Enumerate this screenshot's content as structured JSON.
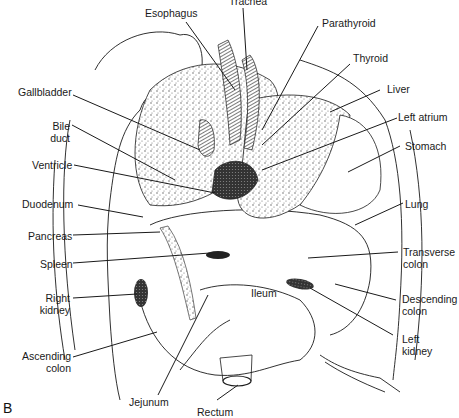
{
  "figure": {
    "panel_label": "B",
    "labels": {
      "trachea": "Trachea",
      "esophagus": "Esophagus",
      "parathyroid": "Parathyroid",
      "thyroid": "Thyroid",
      "liver": "Liver",
      "left_atrium": "Left atrium",
      "stomach": "Stomach",
      "lung": "Lung",
      "transverse_colon_1": "Transverse",
      "transverse_colon_2": "colon",
      "descending_colon_1": "Descending",
      "descending_colon_2": "colon",
      "left_kidney_1": "Left",
      "left_kidney_2": "kidney",
      "gallbladder": "Gallbladder",
      "bile_duct_1": "Bile",
      "bile_duct_2": "duct",
      "ventricle": "Ventricle",
      "duodenum": "Duodenum",
      "pancreas": "Pancreas",
      "spleen": "Spleen",
      "right_kidney_1": "Right",
      "right_kidney_2": "kidney",
      "ascending_colon_1": "Ascending",
      "ascending_colon_2": "colon",
      "ileum": "Ileum",
      "jejunum": "Jejunum",
      "rectum": "Rectum"
    },
    "colors": {
      "line": "#1a1a1a",
      "background": "#ffffff",
      "stipple": "#9a9a9a"
    }
  }
}
